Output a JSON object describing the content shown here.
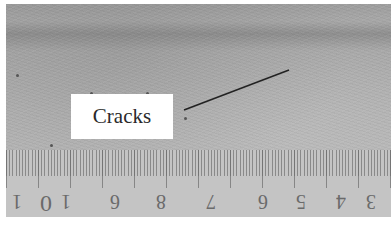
{
  "figure": {
    "annotation_label": "Cracks",
    "ruler_numbers": [
      "1",
      "0",
      "1",
      "6",
      "8",
      "7",
      "6",
      "5",
      "4",
      "3"
    ],
    "colors": {
      "background": "#ffffff",
      "surface": "#a8a8a8",
      "ruler": "#c4c4c4",
      "leader_line": "#222222",
      "label_box": "#ffffff"
    }
  }
}
